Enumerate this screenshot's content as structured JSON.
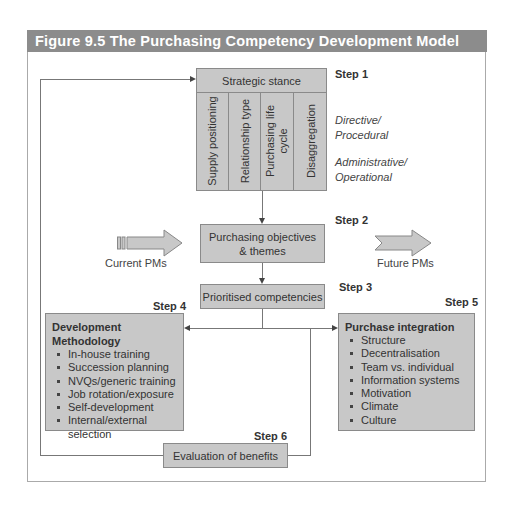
{
  "figure": {
    "title": "Figure 9.5 The Purchasing Competency Development Model"
  },
  "step1": {
    "label": "Step 1",
    "title": "Strategic stance",
    "columns": [
      "Supply positioning",
      "Relationship type",
      "Purchasing life cycle",
      "Disaggregation"
    ],
    "side_labels": [
      "Directive/ Procedural",
      "Administrative/ Operational"
    ]
  },
  "step2": {
    "label": "Step 2",
    "title": "Purchasing objectives & themes"
  },
  "step3": {
    "label": "Step 3",
    "title": "Prioritised competencies"
  },
  "step4": {
    "label": "Step 4",
    "title": "Development Methodology",
    "items": [
      "In-house training",
      "Succession planning",
      "NVQs/generic training",
      "Job rotation/exposure",
      "Self-development",
      "Internal/external selection"
    ]
  },
  "step5": {
    "label": "Step 5",
    "title": "Purchase integration",
    "items": [
      "Structure",
      "Decentralisation",
      "Team vs. individual",
      "Information systems",
      "Motivation",
      "Climate",
      "Culture"
    ]
  },
  "step6": {
    "label": "Step 6",
    "title": "Evaluation of benefits"
  },
  "arrows": {
    "left_label": "Current PMs",
    "right_label": "Future PMs"
  },
  "colors": {
    "header_bg": "#8c8c8c",
    "box_fill": "#c8c8c8",
    "box_border": "#8a8a8a",
    "line": "#777777"
  }
}
